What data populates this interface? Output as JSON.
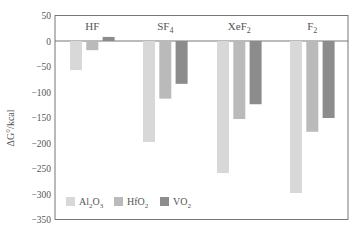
{
  "chart_data": {
    "type": "bar",
    "title": "",
    "xlabel": "",
    "ylabel": "ΔG°/kcal",
    "ylim": [
      -350,
      50
    ],
    "yticks": [
      50,
      0,
      -50,
      -100,
      -150,
      -200,
      -250,
      -300,
      -350
    ],
    "ytick_labels": [
      "50",
      "0",
      "−50",
      "−100",
      "−150",
      "−200",
      "−250",
      "−300",
      "−350"
    ],
    "grid": false,
    "legend_position": "lower left",
    "categories": [
      {
        "base": "HF",
        "sub": ""
      },
      {
        "base": "SF",
        "sub": "4"
      },
      {
        "base": "XeF",
        "sub": "2"
      },
      {
        "base": "F",
        "sub": "2"
      }
    ],
    "category_names": [
      "HF",
      "SF4",
      "XeF2",
      "F2"
    ],
    "series": [
      {
        "name": "Al2O3",
        "label_parts": [
          [
            "Al",
            ""
          ],
          [
            "2",
            "sub"
          ],
          [
            "O",
            ""
          ],
          [
            "3",
            "sub"
          ]
        ],
        "color": "#d8d8d8",
        "values": [
          -57,
          -198,
          -259,
          -298
        ]
      },
      {
        "name": "HfO2",
        "label_parts": [
          [
            "HfO",
            ""
          ],
          [
            "2",
            "sub"
          ]
        ],
        "color": "#bababa",
        "values": [
          -18,
          -113,
          -153,
          -178
        ]
      },
      {
        "name": "VO2",
        "label_parts": [
          [
            "VO",
            ""
          ],
          [
            "2",
            "sub"
          ]
        ],
        "color": "#8c8c8c",
        "values": [
          8,
          -84,
          -124,
          -151
        ]
      }
    ]
  }
}
